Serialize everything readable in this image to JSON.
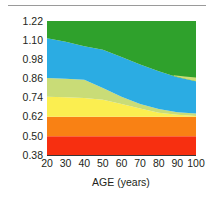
{
  "figure": {
    "background_color": "#ffffff",
    "has_top_rule": true,
    "top_rule_color": "#9a9a9a"
  },
  "chart_data": {
    "type": "area",
    "stacked": true,
    "title": "",
    "subtitle": "",
    "xlabel": "AGE (years)",
    "ylabel": "",
    "x": [
      20,
      30,
      40,
      50,
      60,
      70,
      80,
      90,
      100
    ],
    "xtick_labels": [
      "20",
      "30",
      "40",
      "50",
      "60",
      "70",
      "80",
      "90",
      "100"
    ],
    "ytick_labels": [
      "1.22",
      "1.10",
      "0.98",
      "0.86",
      "0.74",
      "0.62",
      "0.50",
      "0.38"
    ],
    "ytick_values": [
      1.22,
      1.1,
      0.98,
      0.86,
      0.74,
      0.62,
      0.5,
      0.38
    ],
    "xlim": [
      20,
      100
    ],
    "ylim": [
      0.38,
      1.22
    ],
    "ybase": 0.38,
    "grid": false,
    "legend": "none",
    "series": [
      {
        "name": "band-red",
        "color": "#f72f10",
        "upper_bounds": [
          0.497,
          0.497,
          0.497,
          0.497,
          0.497,
          0.497,
          0.497,
          0.497,
          0.497
        ]
      },
      {
        "name": "band-orange",
        "color": "#f98114",
        "upper_bounds": [
          0.62,
          0.62,
          0.62,
          0.62,
          0.62,
          0.62,
          0.62,
          0.62,
          0.62
        ]
      },
      {
        "name": "band-yellow",
        "color": "#fbee50",
        "upper_bounds": [
          0.745,
          0.742,
          0.738,
          0.726,
          0.7,
          0.672,
          0.645,
          0.632,
          0.625
        ]
      },
      {
        "name": "band-yellow-green",
        "color": "#c9dc77",
        "upper_bounds": [
          0.862,
          0.858,
          0.852,
          0.8,
          0.745,
          0.7,
          0.668,
          0.648,
          0.64
        ]
      },
      {
        "name": "band-blue",
        "color": "#2bace3",
        "upper_bounds": [
          1.112,
          1.09,
          1.062,
          1.04,
          0.995,
          0.948,
          0.905,
          0.868,
          0.842
        ]
      },
      {
        "name": "band-green",
        "color": "#2fa12c",
        "upper_bounds": [
          1.22,
          1.22,
          1.22,
          1.22,
          1.22,
          1.22,
          1.22,
          1.22,
          1.22
        ]
      }
    ],
    "green_lower_notch": {
      "note": "thin yellow-green sliver re-emerges near the right edge between blue and green",
      "x": [
        88,
        94,
        100
      ],
      "upper_bounds": [
        0.88,
        0.872,
        0.866
      ]
    },
    "axis_line_color": "#231f20"
  }
}
